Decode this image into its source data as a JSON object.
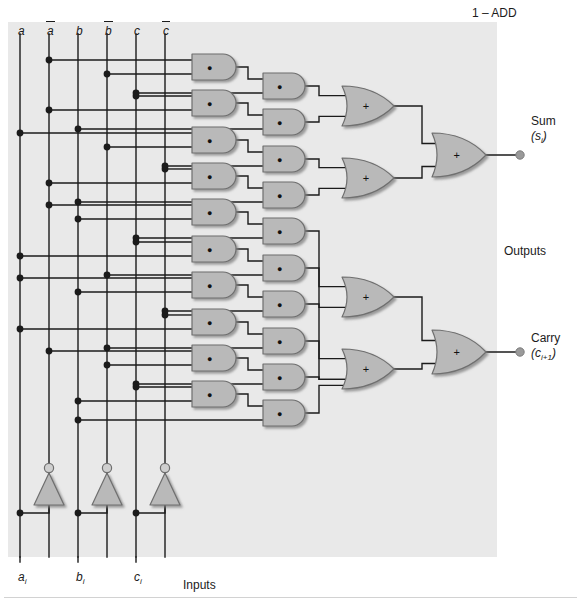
{
  "figure": {
    "title": "1 – ADD",
    "kind": "full-adder-logic-diagram"
  },
  "bus_labels": [
    {
      "id": "bus-a",
      "text": "a",
      "bar": false,
      "x": 18,
      "y": 24
    },
    {
      "id": "bus-a-bar",
      "text": "a",
      "bar": true,
      "x": 47,
      "y": 24
    },
    {
      "id": "bus-b",
      "text": "b",
      "bar": false,
      "x": 76,
      "y": 24
    },
    {
      "id": "bus-b-bar",
      "text": "b",
      "bar": true,
      "x": 105,
      "y": 24
    },
    {
      "id": "bus-c",
      "text": "c",
      "bar": false,
      "x": 134,
      "y": 24
    },
    {
      "id": "bus-c-bar",
      "text": "c",
      "bar": true,
      "x": 163,
      "y": 24
    }
  ],
  "input_labels": [
    {
      "id": "input-a",
      "main": "a",
      "sub": "i",
      "x": 18,
      "y": 570
    },
    {
      "id": "input-b",
      "main": "b",
      "sub": "i",
      "x": 76,
      "y": 570
    },
    {
      "id": "input-c",
      "main": "c",
      "sub": "i",
      "x": 134,
      "y": 570
    }
  ],
  "input_group_label": "Inputs",
  "output_group_label": "Outputs",
  "outputs": [
    {
      "id": "output-sum",
      "name": "Sum",
      "expr_main": "(s",
      "expr_sub": "i",
      "expr_tail": ")",
      "x": 531,
      "y": 124
    },
    {
      "id": "output-carry",
      "name": "Carry",
      "expr_main": "(c",
      "expr_sub": "i+1",
      "expr_tail": ")",
      "x": 531,
      "y": 341
    }
  ],
  "gate_symbols": {
    "and": "●",
    "or": "+"
  },
  "colors": {
    "panel": "#e9e9e9",
    "gate_fill": "#b9b9b9",
    "gate_stroke": "#6f6f6f",
    "wire": "#1b1b1b",
    "node": "#1b1b1b",
    "terminal": "#9a9a9a",
    "text": "#1b1b1b"
  },
  "counts": {
    "and_column_1": 8,
    "and_column_2": 8,
    "or_column_3": 4,
    "or_column_4": 2,
    "inverters": 3,
    "vertical_buses": 6
  }
}
